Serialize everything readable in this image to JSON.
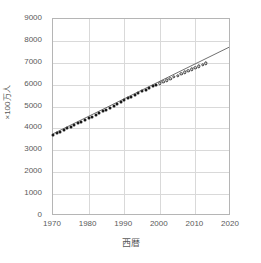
{
  "chart_data": {
    "type": "scatter",
    "title": "",
    "xlabel": "西暦",
    "ylabel": "×100万人",
    "xlim": [
      1970,
      2020
    ],
    "ylim": [
      0,
      9000
    ],
    "grid": true,
    "legend": false,
    "x_ticks": [
      1970,
      1980,
      1990,
      2000,
      2010,
      2020
    ],
    "y_ticks": [
      0,
      1000,
      2000,
      3000,
      4000,
      5000,
      6000,
      7000,
      8000,
      9000
    ],
    "x_tick_labels": [
      "1970",
      "1980",
      "1990",
      "2000",
      "2010",
      "2020"
    ],
    "y_tick_labels": [
      "0",
      "1000",
      "2000",
      "3000",
      "4000",
      "5000",
      "6000",
      "7000",
      "8000",
      "9000"
    ],
    "series": [
      {
        "name": "observed",
        "marker": "filled-circle",
        "color": "#1a1a1a",
        "x": [
          1970,
          1971,
          1972,
          1973,
          1974,
          1975,
          1976,
          1977,
          1978,
          1979,
          1980,
          1981,
          1982,
          1983,
          1984,
          1985,
          1986,
          1987,
          1988,
          1989,
          1990,
          1991,
          1992,
          1993,
          1994,
          1995,
          1996,
          1997,
          1998,
          1999
        ],
        "values": [
          3700,
          3775,
          3851,
          3927,
          4003,
          4079,
          4155,
          4233,
          4312,
          4393,
          4458,
          4536,
          4616,
          4698,
          4780,
          4863,
          4947,
          5032,
          5118,
          5204,
          5288,
          5371,
          5452,
          5532,
          5611,
          5689,
          5766,
          5842,
          5917,
          5991
        ]
      },
      {
        "name": "recent",
        "marker": "open-circle",
        "color": "#333333",
        "x": [
          2000,
          2001,
          2002,
          2003,
          2004,
          2005,
          2006,
          2007,
          2008,
          2009,
          2010,
          2011,
          2012,
          2013
        ],
        "values": [
          6064,
          6136,
          6207,
          6278,
          6348,
          6418,
          6488,
          6558,
          6628,
          6698,
          6768,
          6838,
          6908,
          6978
        ]
      }
    ],
    "trendline": {
      "name": "linear-trend",
      "color": "#4a4a4a",
      "x": [
        1970,
        2020
      ],
      "values": [
        3700,
        7700
      ]
    }
  }
}
